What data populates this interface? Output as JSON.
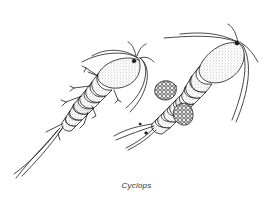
{
  "figure": {
    "caption": "Cyclops",
    "style": "black-and-white stippled line illustration",
    "colors": {
      "background": "#ffffff",
      "ink": "#1a1a1a",
      "caption": "#333333"
    },
    "specimens": [
      {
        "id": "left",
        "description": "copepod without egg sacs, dorsal view, oriented diagonally"
      },
      {
        "id": "right",
        "description": "female copepod with paired egg sacs, dorsal view, oriented diagonally"
      }
    ]
  }
}
